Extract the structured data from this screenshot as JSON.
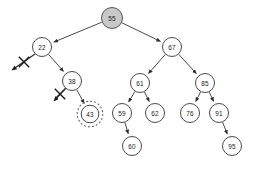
{
  "figure": {
    "background_color": "#ffffff",
    "node_fill": "#ffffff",
    "node_stroke": "#4a4a4a",
    "root_fill": "#c8c8c8",
    "highlight_stroke": "#6b6b6b",
    "edge_color": "#4a4a4a"
  },
  "tree": {
    "type": "binary-search-tree",
    "root_key": "55",
    "nodes": [
      {
        "id": "n55",
        "label": "55",
        "x": 112,
        "y": 18,
        "r": 10.5,
        "level": 0,
        "highlighted": false,
        "shaded": true
      },
      {
        "id": "n22",
        "label": "22",
        "x": 42,
        "y": 47,
        "r": 9.5,
        "level": 1,
        "highlighted": false,
        "shaded": false
      },
      {
        "id": "n67",
        "label": "67",
        "x": 172,
        "y": 47,
        "r": 9.5,
        "level": 1,
        "highlighted": false,
        "shaded": false
      },
      {
        "id": "n38",
        "label": "38",
        "x": 72,
        "y": 81,
        "r": 9.5,
        "level": 2,
        "highlighted": false,
        "shaded": false
      },
      {
        "id": "n61",
        "label": "61",
        "x": 140,
        "y": 83,
        "r": 9.5,
        "level": 2,
        "highlighted": false,
        "shaded": false
      },
      {
        "id": "n85",
        "label": "85",
        "x": 205,
        "y": 83,
        "r": 9.5,
        "level": 2,
        "highlighted": false,
        "shaded": false
      },
      {
        "id": "n43",
        "label": "43",
        "x": 90,
        "y": 114,
        "r": 8.8,
        "level": 3,
        "highlighted": true,
        "shaded": false
      },
      {
        "id": "n59",
        "label": "59",
        "x": 122,
        "y": 113,
        "r": 9.5,
        "level": 3,
        "highlighted": false,
        "shaded": false
      },
      {
        "id": "n62",
        "label": "62",
        "x": 155,
        "y": 113,
        "r": 9.5,
        "level": 3,
        "highlighted": false,
        "shaded": false
      },
      {
        "id": "n76",
        "label": "76",
        "x": 190,
        "y": 113,
        "r": 9.5,
        "level": 3,
        "highlighted": false,
        "shaded": false
      },
      {
        "id": "n91",
        "label": "91",
        "x": 219,
        "y": 113,
        "r": 9.5,
        "level": 3,
        "highlighted": false,
        "shaded": false
      },
      {
        "id": "n60",
        "label": "60",
        "x": 132,
        "y": 146,
        "r": 9.5,
        "level": 4,
        "highlighted": false,
        "shaded": false
      },
      {
        "id": "n95",
        "label": "95",
        "x": 232,
        "y": 146,
        "r": 9.5,
        "level": 4,
        "highlighted": false,
        "shaded": false
      }
    ],
    "edges": [
      {
        "from": "n55",
        "to": "n22",
        "side": "left"
      },
      {
        "from": "n55",
        "to": "n67",
        "side": "right"
      },
      {
        "from": "n22",
        "to": "n38",
        "side": "right"
      },
      {
        "from": "n38",
        "to": "n43",
        "side": "right"
      },
      {
        "from": "n67",
        "to": "n61",
        "side": "left"
      },
      {
        "from": "n67",
        "to": "n85",
        "side": "right"
      },
      {
        "from": "n61",
        "to": "n59",
        "side": "left"
      },
      {
        "from": "n61",
        "to": "n62",
        "side": "right"
      },
      {
        "from": "n85",
        "to": "n76",
        "side": "left"
      },
      {
        "from": "n85",
        "to": "n91",
        "side": "right"
      },
      {
        "from": "n59",
        "to": "n60",
        "side": "right"
      },
      {
        "from": "n91",
        "to": "n95",
        "side": "right"
      }
    ],
    "null_pointers": [
      {
        "from": "n22",
        "side": "left",
        "x1": 35,
        "y1": 54,
        "x2": 12,
        "y2": 70,
        "cross_x": 24,
        "cross_y": 62
      },
      {
        "from": "n38",
        "side": "left",
        "x1": 66,
        "y1": 88,
        "x2": 54,
        "y2": 101,
        "cross_x": 60,
        "cross_y": 94
      }
    ],
    "highlight": {
      "node_id": "n43",
      "label": "43",
      "ring_radius": 12.8,
      "style": "dashed-circle"
    }
  }
}
